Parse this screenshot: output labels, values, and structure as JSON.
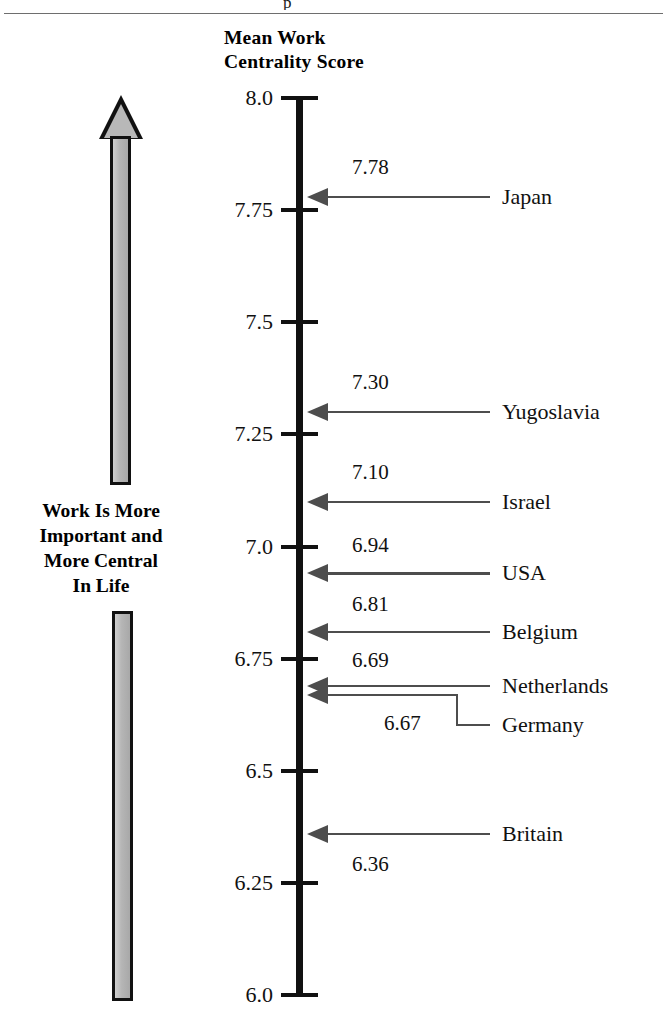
{
  "page": {
    "top_glyph": "p",
    "axis_title_line1": "Mean Work",
    "axis_title_line2": "Centrality Score",
    "left_caption_line1": "Work Is More",
    "left_caption_line2": "Important and",
    "left_caption_line3": "More Central",
    "left_caption_line4": "In Life",
    "left_arrow_name": "upward-direction-arrow"
  },
  "chart_data": {
    "type": "bar",
    "orientation": "vertical-number-line",
    "title": "Mean Work Centrality Score",
    "xlabel": "",
    "ylabel": "Mean Work Centrality Score",
    "ylim": [
      6.0,
      8.0
    ],
    "grid": false,
    "legend": "none",
    "annotation": "Work Is More Important and More Central In Life",
    "tick_labels": [
      "8.0",
      "7.75",
      "7.5",
      "7.25",
      "7.0",
      "6.75",
      "6.5",
      "6.25",
      "6.0"
    ],
    "ticks": [
      8.0,
      7.75,
      7.5,
      7.25,
      7.0,
      6.75,
      6.5,
      6.25,
      6.0
    ],
    "categories": [
      "Japan",
      "Yugoslavia",
      "Israel",
      "USA",
      "Belgium",
      "Netherlands",
      "Germany",
      "Britain"
    ],
    "values": [
      7.78,
      7.3,
      7.1,
      6.94,
      6.81,
      6.69,
      6.67,
      6.36
    ],
    "value_labels": [
      "7.78",
      "7.30",
      "7.10",
      "6.94",
      "6.81",
      "6.69",
      "6.67",
      "6.36"
    ],
    "points": [
      {
        "country": "Japan",
        "value": 7.78,
        "label": "7.78"
      },
      {
        "country": "Yugoslavia",
        "value": 7.3,
        "label": "7.30"
      },
      {
        "country": "Israel",
        "value": 7.1,
        "label": "7.10"
      },
      {
        "country": "USA",
        "value": 6.94,
        "label": "6.94"
      },
      {
        "country": "Belgium",
        "value": 6.81,
        "label": "6.81"
      },
      {
        "country": "Netherlands",
        "value": 6.69,
        "label": "6.69"
      },
      {
        "country": "Germany",
        "value": 6.67,
        "label": "6.67"
      },
      {
        "country": "Britain",
        "value": 6.36,
        "label": "6.36"
      }
    ]
  },
  "colors": {
    "axis": "#111111",
    "leader": "#4d4d4d",
    "arrow_fill": "#b5b5b5",
    "arrow_outline": "#111111",
    "rule": "#6e6e6e",
    "background": "#ffffff"
  }
}
